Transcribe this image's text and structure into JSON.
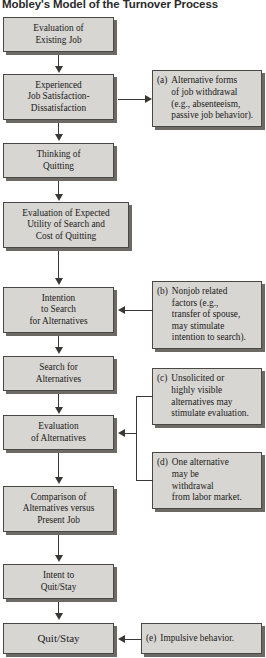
{
  "title": "Mobley's Model of the Turnover Process",
  "colors": {
    "box_fill": "#d8d6d2",
    "box_border": "#4a4845",
    "box_shadow": "#6d6a66",
    "connector": "#3a3836",
    "background": "#ffffff",
    "text": "#1a1a1a"
  },
  "flow": {
    "nodes": [
      {
        "id": "evaluation-existing-job",
        "lines": [
          "Evaluation of",
          "Existing Job"
        ]
      },
      {
        "id": "experienced-job-satisfaction",
        "lines": [
          "Experienced",
          "Job Satisfaction-",
          "Dissatisfaction"
        ]
      },
      {
        "id": "thinking-of-quitting",
        "lines": [
          "Thinking of",
          "Quitting"
        ]
      },
      {
        "id": "evaluation-expected-utility",
        "lines": [
          "Evaluation of Expected",
          "Utility of Search and",
          "Cost of Quitting"
        ]
      },
      {
        "id": "intention-to-search",
        "lines": [
          "Intention",
          "to Search",
          "for Alternatives"
        ]
      },
      {
        "id": "search-for-alternatives",
        "lines": [
          "Search for",
          "Alternatives"
        ]
      },
      {
        "id": "evaluation-of-alternatives",
        "lines": [
          "Evaluation",
          "of Alternatives"
        ]
      },
      {
        "id": "comparison-of-alternatives",
        "lines": [
          "Comparison of",
          "Alternatives versus",
          "Present Job"
        ]
      },
      {
        "id": "intent-to-quit-stay",
        "lines": [
          "Intent to",
          "Quit/Stay"
        ]
      },
      {
        "id": "quit-stay",
        "lines": [
          "Quit/Stay"
        ]
      }
    ]
  },
  "notes": [
    {
      "id": "note-a",
      "tag": "(a)",
      "lines": [
        "Alternative forms",
        "of job withdrawal",
        "(e.g., absenteeism,",
        "passive job behavior)."
      ],
      "targets": "experienced-job-satisfaction"
    },
    {
      "id": "note-b",
      "tag": "(b)",
      "lines": [
        "Nonjob related",
        "factors (e.g.,",
        "transfer of spouse,",
        "may stimulate",
        "intention to search)."
      ],
      "targets": "intention-to-search"
    },
    {
      "id": "note-c",
      "tag": "(c)",
      "lines": [
        "Unsolicited or",
        "highly visible",
        "alternatives may",
        "stimulate evaluation."
      ],
      "targets": "evaluation-of-alternatives"
    },
    {
      "id": "note-d",
      "tag": "(d)",
      "lines": [
        "One alternative",
        "may be",
        "withdrawal",
        "from labor market."
      ],
      "targets": "evaluation-of-alternatives"
    },
    {
      "id": "note-e",
      "tag": "(e)",
      "lines": [
        "Impulsive behavior."
      ],
      "targets": "quit-stay"
    }
  ]
}
